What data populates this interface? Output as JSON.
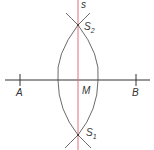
{
  "diagram": {
    "line_label": "s",
    "points": {
      "A": {
        "label": "A"
      },
      "B": {
        "label": "B"
      },
      "M": {
        "label": "M"
      },
      "S1": {
        "label": "S",
        "sub": "1"
      },
      "S2": {
        "label": "S",
        "sub": "2"
      }
    },
    "colors": {
      "line": "#333333",
      "bisector": "#e0707a",
      "background": "#ffffff"
    }
  }
}
